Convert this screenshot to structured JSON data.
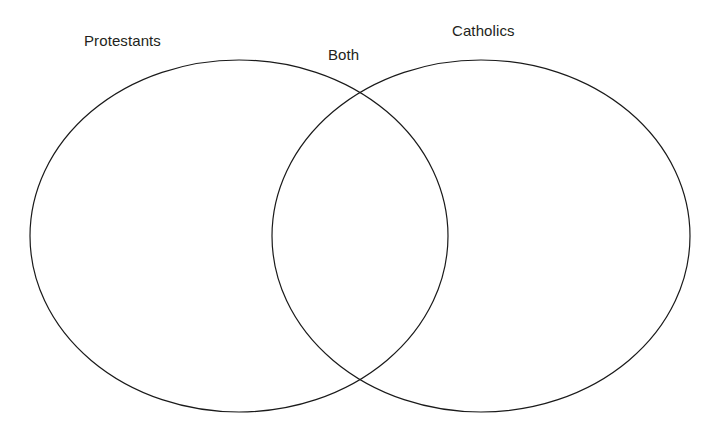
{
  "diagram": {
    "type": "venn-two-set",
    "background_color": "#ffffff",
    "stroke_color": "#1a1a1a",
    "text_color": "#231f20",
    "fill": "none",
    "labels": {
      "left_set": "Protestants",
      "intersection": "Both",
      "right_set": "Catholics"
    },
    "shapes": {
      "left_ellipse": {
        "name": "protestants-ellipse",
        "cx": 239,
        "cy": 236,
        "rx": 209,
        "ry": 176
      },
      "right_ellipse": {
        "name": "catholics-ellipse",
        "cx": 481,
        "cy": 236,
        "rx": 209,
        "ry": 176
      }
    }
  },
  "chart_data": {
    "type": "diagram",
    "title": "",
    "sets": [
      {
        "name": "Protestants",
        "position": "left"
      },
      {
        "name": "Catholics",
        "position": "right"
      }
    ],
    "intersection_label": "Both",
    "values": [],
    "legend": "none",
    "grid": false
  }
}
